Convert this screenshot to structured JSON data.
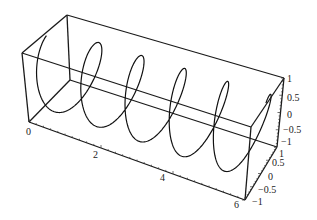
{
  "chart_data": {
    "type": "line3d",
    "title": "",
    "x_range": [
      0,
      6
    ],
    "y_range": [
      -1,
      1
    ],
    "z_range": [
      -1,
      1
    ],
    "turns": 5,
    "x_ticks": [
      "0",
      "2",
      "4",
      "6"
    ],
    "y_ticks": [
      "1",
      "0.5",
      "0",
      "-0.5",
      "-1"
    ],
    "z_ticks": [
      "1",
      "0.5",
      "0",
      "-0.5",
      "-1"
    ],
    "grid": false,
    "box": true,
    "line_color": "#111111"
  },
  "projection": {
    "corners": {
      "x0_yneg_zneg": [
        29,
        122
      ],
      "x0_ypos_zneg": [
        70,
        80
      ],
      "x0_yneg_zpos": [
        22,
        53
      ],
      "x0_ypos_zpos": [
        67,
        15
      ],
      "x6_yneg_zneg": [
        245,
        200
      ],
      "x6_ypos_zneg": [
        277,
        147
      ],
      "x6_yneg_zpos": [
        251,
        127
      ],
      "x6_ypos_zpos": [
        284,
        78
      ]
    }
  },
  "labels": {
    "x": [
      {
        "text": "0",
        "x": 26,
        "y": 135
      },
      {
        "text": "2",
        "x": 93,
        "y": 158
      },
      {
        "text": "4",
        "x": 160,
        "y": 181
      },
      {
        "text": "6",
        "x": 234,
        "y": 208
      }
    ],
    "z": [
      {
        "text": "1",
        "x": 287,
        "y": 82
      },
      {
        "text": "0.5",
        "x": 287,
        "y": 101
      },
      {
        "text": "0",
        "x": 287,
        "y": 118
      },
      {
        "text": "−0.5",
        "x": 283,
        "y": 133
      },
      {
        "text": "−1",
        "x": 281,
        "y": 145
      }
    ],
    "y": [
      {
        "text": "1",
        "x": 279,
        "y": 157
      },
      {
        "text": "0.5",
        "x": 272,
        "y": 166
      },
      {
        "text": "0",
        "x": 268,
        "y": 180
      },
      {
        "text": "−0.5",
        "x": 258,
        "y": 193
      },
      {
        "text": "−1",
        "x": 252,
        "y": 205
      }
    ]
  }
}
